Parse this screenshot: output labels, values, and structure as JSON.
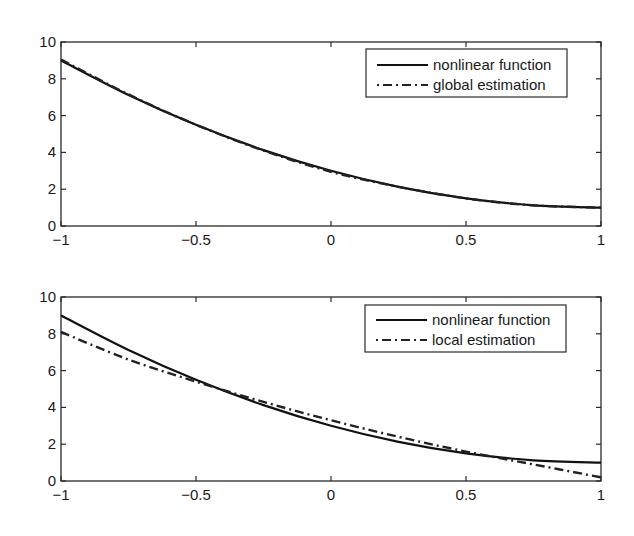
{
  "chart_data": [
    {
      "type": "line",
      "title": "",
      "xlabel": "",
      "ylabel": "",
      "xlim": [
        -1,
        1
      ],
      "ylim": [
        0,
        10
      ],
      "xticks": [
        -1,
        -0.5,
        0,
        0.5,
        1
      ],
      "xtick_labels": [
        "−1",
        "−0.5",
        "0",
        "0.5",
        "1"
      ],
      "yticks": [
        0,
        2,
        4,
        6,
        8,
        10
      ],
      "ytick_labels": [
        "0",
        "2",
        "4",
        "6",
        "8",
        "10"
      ],
      "grid": false,
      "legend_position": "upper right",
      "x": [
        -1,
        -0.75,
        -0.5,
        -0.25,
        0,
        0.25,
        0.5,
        0.75,
        1
      ],
      "series": [
        {
          "name": "nonlinear function",
          "style": "solid",
          "values": [
            9.0,
            7.125,
            5.5,
            4.125,
            3.0,
            2.125,
            1.5,
            1.125,
            1.0
          ]
        },
        {
          "name": "global estimation",
          "style": "dash-dot",
          "values": [
            9.05,
            7.15,
            5.5,
            4.1,
            2.95,
            2.13,
            1.5,
            1.12,
            1.0
          ]
        }
      ]
    },
    {
      "type": "line",
      "title": "",
      "xlabel": "",
      "ylabel": "",
      "xlim": [
        -1,
        1
      ],
      "ylim": [
        0,
        10
      ],
      "xticks": [
        -1,
        -0.5,
        0,
        0.5,
        1
      ],
      "xtick_labels": [
        "−1",
        "−0.5",
        "0",
        "0.5",
        "1"
      ],
      "yticks": [
        0,
        2,
        4,
        6,
        8,
        10
      ],
      "ytick_labels": [
        "0",
        "2",
        "4",
        "6",
        "8",
        "10"
      ],
      "grid": false,
      "legend_position": "upper right",
      "x": [
        -1,
        -0.75,
        -0.5,
        -0.25,
        0,
        0.25,
        0.5,
        0.75,
        1
      ],
      "series": [
        {
          "name": "nonlinear function",
          "style": "solid",
          "values": [
            9.0,
            7.125,
            5.5,
            4.125,
            3.0,
            2.125,
            1.5,
            1.125,
            1.0
          ]
        },
        {
          "name": "local estimation",
          "style": "dash-dot",
          "values": [
            8.1,
            6.6,
            5.4,
            4.3,
            3.3,
            2.4,
            1.6,
            0.9,
            0.2
          ]
        }
      ]
    }
  ],
  "plots": [
    {
      "legend": [
        "nonlinear function",
        "global estimation"
      ]
    },
    {
      "legend": [
        "nonlinear function",
        "local estimation"
      ]
    }
  ]
}
